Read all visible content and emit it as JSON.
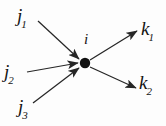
{
  "figure": {
    "type": "vertex-interaction-diagram",
    "background_color": "#fdfdfd",
    "line_color": "#262626",
    "text_color": "#141414",
    "width": 166,
    "height": 126
  },
  "vertex": {
    "name": "interaction-vertex",
    "label_base": "i",
    "label_sub": "",
    "cx": 85,
    "cy": 63,
    "r": 5.2,
    "label_x": 84,
    "label_y": 31
  },
  "incoming": [
    {
      "id": "j1",
      "base": "j",
      "sub": "1",
      "label_x": 17,
      "label_y": 6,
      "x1": 38,
      "y1": 21,
      "x2": 79,
      "y2": 59
    },
    {
      "id": "j2",
      "base": "j",
      "sub": "2",
      "label_x": 4,
      "label_y": 62,
      "x1": 27,
      "y1": 72,
      "x2": 78,
      "y2": 63
    },
    {
      "id": "j3",
      "base": "j",
      "sub": "3",
      "label_x": 18,
      "label_y": 97,
      "x1": 33,
      "y1": 103,
      "x2": 79,
      "y2": 68
    }
  ],
  "outgoing": [
    {
      "id": "k1",
      "base": "k",
      "sub": "1",
      "label_x": 141,
      "label_y": 19,
      "x1": 90,
      "y1": 60,
      "x2": 137,
      "y2": 31
    },
    {
      "id": "k2",
      "base": "k",
      "sub": "2",
      "label_x": 139,
      "label_y": 73,
      "x1": 90,
      "y1": 67,
      "x2": 136,
      "y2": 88
    }
  ]
}
